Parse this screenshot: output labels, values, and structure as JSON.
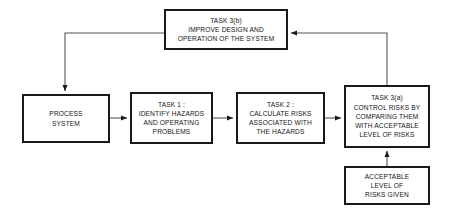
{
  "diagram": {
    "stroke_color": "#1a1a1a",
    "connector_color": "#555555",
    "background_color": "#ffffff",
    "nodes": {
      "task3b": {
        "lines": [
          "TASK 3(b)",
          "IMPROVE DESIGN AND",
          "OPERATION OF THE SYSTEM"
        ]
      },
      "process_system": {
        "lines": [
          "PROCESS",
          "SYSTEM"
        ]
      },
      "task1": {
        "lines": [
          "TASK 1 :",
          "IDENTIFY HAZARDS",
          "AND OPERATING",
          "PROBLEMS"
        ]
      },
      "task2": {
        "lines": [
          "TASK 2 :",
          "CALCULATE RISKS",
          "ASSOCIATED WITH",
          "THE HAZARDS"
        ]
      },
      "task3a": {
        "lines": [
          "TASK 3(a)",
          "CONTROL RISKS BY",
          "COMPARING THEM",
          "WITH ACCEPTABLE",
          "LEVEL OF RISKS"
        ]
      },
      "acceptable_level": {
        "lines": [
          "ACCEPTABLE",
          "LEVEL OF",
          "RISKS GIVEN"
        ]
      }
    },
    "connectors": [
      {
        "name": "process-to-task1",
        "from": "process_system",
        "to": "task1"
      },
      {
        "name": "task1-to-task2",
        "from": "task1",
        "to": "task2"
      },
      {
        "name": "task2-to-task3a",
        "from": "task2",
        "to": "task3a"
      },
      {
        "name": "acceptable-to-task3a",
        "from": "acceptable_level",
        "to": "task3a"
      },
      {
        "name": "task3a-to-task3b",
        "from": "task3a",
        "to": "task3b"
      },
      {
        "name": "task3b-to-process",
        "from": "task3b",
        "to": "process_system"
      }
    ]
  }
}
